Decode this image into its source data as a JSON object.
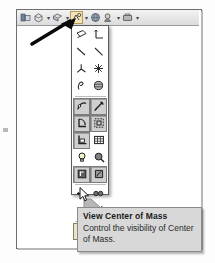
{
  "app": {
    "title": "CAD view toolbar flyout",
    "accent_pressed": "#cfcfcf",
    "accent_hot": "#f4e4bb",
    "tooltip_bg": "#d8d8d8",
    "panel_border": "#5d5d5d"
  },
  "toolbar": {
    "name": "view-toolbar",
    "items": [
      {
        "name": "zoom-to-fit-button",
        "icon": "zoom-to-fit-icon",
        "label": "Zoom to Fit",
        "split": false,
        "active": false
      },
      {
        "name": "zoom-to-area-button",
        "icon": "zoom-to-area-icon",
        "label": "Zoom to Area",
        "split": true,
        "active": false
      },
      {
        "name": "previous-view-button",
        "icon": "previous-view-icon",
        "label": "Previous View",
        "split": true,
        "active": false
      },
      {
        "name": "hide-show-items-button",
        "icon": "hide-show-items-icon",
        "label": "Hide/Show Items",
        "split": true,
        "active": true
      },
      {
        "name": "display-style-button",
        "icon": "display-style-icon",
        "label": "Display Style",
        "split": false,
        "active": false
      },
      {
        "name": "view-orientation-button",
        "icon": "view-orientation-icon",
        "label": "View Orientation",
        "split": true,
        "active": false
      },
      {
        "name": "apply-scene-button",
        "icon": "apply-scene-icon",
        "label": "Apply Scene",
        "split": true,
        "active": false
      }
    ]
  },
  "flyout": {
    "name": "hide-show-items-flyout",
    "groups": [
      {
        "items": [
          {
            "name": "view-planes-item",
            "icon": "plane-icon",
            "label": "View Planes",
            "state": "normal"
          },
          {
            "name": "view-axes-item",
            "icon": "axis-icon",
            "label": "View Axes",
            "state": "normal"
          },
          {
            "name": "view-temporary-axes-item",
            "icon": "temporary-axis-icon",
            "label": "View Temporary Axes",
            "state": "normal"
          },
          {
            "name": "view-origins-item",
            "icon": "origin-icon",
            "label": "View Origins",
            "state": "normal"
          },
          {
            "name": "view-coordinate-systems-item",
            "icon": "coordinate-system-icon",
            "label": "View Coordinate Systems",
            "state": "normal"
          },
          {
            "name": "view-points-item",
            "icon": "point-icon",
            "label": "View Points",
            "state": "normal"
          },
          {
            "name": "view-routing-points-item",
            "icon": "routing-point-icon",
            "label": "View Routing Points",
            "state": "normal"
          },
          {
            "name": "view-parting-lines-item",
            "icon": "parting-line-icon",
            "label": "View Parting Lines",
            "state": "normal"
          }
        ]
      },
      {
        "items": [
          {
            "name": "view-curves-item",
            "icon": "curve-icon",
            "label": "View Curves",
            "state": "pressed"
          },
          {
            "name": "view-sketches-item",
            "icon": "sketch-icon",
            "label": "View Sketches",
            "state": "pressed"
          },
          {
            "name": "view-3d-sketches-item",
            "icon": "sketch-3d-icon",
            "label": "View 3D Sketches",
            "state": "pressed"
          },
          {
            "name": "view-sketch-relations-item",
            "icon": "sketch-relation-icon",
            "label": "View Sketch Relations",
            "state": "pressed"
          },
          {
            "name": "view-sketch-dimensions-item",
            "icon": "sketch-dimension-icon",
            "label": "View Sketch Dimensions",
            "state": "pressed"
          },
          {
            "name": "view-grid-item",
            "icon": "grid-icon",
            "label": "View Grid",
            "state": "normal"
          },
          {
            "name": "view-lights-item",
            "icon": "light-bulb-icon",
            "label": "View Lights",
            "state": "normal"
          },
          {
            "name": "view-cameras-item",
            "icon": "camera-icon",
            "label": "View Cameras",
            "state": "normal"
          },
          {
            "name": "view-all-annotations-item",
            "icon": "annotation-icon",
            "label": "View All Annotations",
            "state": "pressed"
          },
          {
            "name": "view-decals-item",
            "icon": "decal-icon",
            "label": "View Decals",
            "state": "pressed"
          }
        ]
      },
      {
        "items": [
          {
            "name": "view-route-points-item",
            "icon": "route-point-icon",
            "label": "View Route Points",
            "state": "normal"
          },
          {
            "name": "view-weld-beads-item",
            "icon": "weld-bead-icon",
            "label": "View Weld Beads",
            "state": "normal"
          },
          {
            "name": "view-live-section-item",
            "icon": "live-section-icon",
            "label": "View Live Section Planes",
            "state": "normal"
          },
          {
            "name": "view-sensors-item",
            "icon": "sensor-icon",
            "label": "View Sensors",
            "state": "normal"
          }
        ]
      },
      {
        "items": [
          {
            "name": "view-center-of-mass-item",
            "icon": "center-of-mass-icon",
            "label": "View Center of Mass",
            "state": "hot"
          }
        ]
      }
    ]
  },
  "tooltip": {
    "name": "center-of-mass-tooltip",
    "title": "View Center of Mass",
    "body": "Control the visibility of Center of Mass."
  },
  "annotations": {
    "pointer_arrow": "callout-arrow",
    "cursor": "mouse-cursor"
  }
}
